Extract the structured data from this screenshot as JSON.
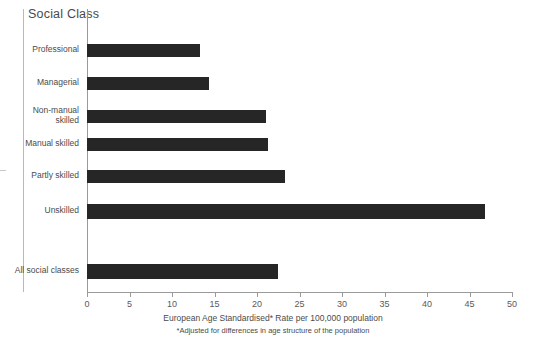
{
  "chart_data": {
    "type": "bar",
    "orientation": "horizontal",
    "title": "Social Class",
    "xlabel": "European Age Standardised* Rate per 100,000 population",
    "ylabel": "Social Class",
    "footnote": "*Adjusted for differences in age structure of the population",
    "categories": [
      "Professional",
      "Managerial",
      "Non-manual\nskilled",
      "Manual skilled",
      "Partly skilled",
      "Unskilled",
      "All social classes"
    ],
    "values": [
      13.3,
      14.3,
      21.0,
      21.3,
      23.3,
      46.8,
      22.5
    ],
    "xlim": [
      0,
      50
    ],
    "xticks": [
      0,
      5,
      10,
      15,
      20,
      25,
      30,
      35,
      40,
      45,
      50
    ],
    "xtick_labels": [
      "0",
      "5",
      "10",
      "15",
      "20",
      "25",
      "30",
      "35",
      "40",
      "45",
      "50"
    ],
    "grid": false,
    "legend": "none",
    "bar_color": "#262626",
    "axis_color": "#9a9a9a",
    "background": "#ffffff"
  }
}
